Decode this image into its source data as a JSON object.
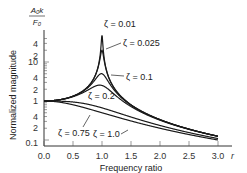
{
  "chart_data": {
    "type": "line",
    "title": "",
    "xlabel": "Frequency ratio",
    "x_symbol": "r",
    "ylabel": "Normalized magnitude",
    "ylabel_fraction": {
      "numerator": "A0k",
      "denominator": "F0"
    },
    "xlim": [
      0,
      3.0
    ],
    "ylim": [
      0.1,
      50
    ],
    "yscale": "log",
    "grid": false,
    "x_ticks": [
      0.0,
      0.5,
      1.0,
      1.5,
      2.0,
      2.5,
      3.0
    ],
    "x_tick_labels": [
      "0.0",
      "0.5",
      "1.0",
      "1.5",
      "2.0",
      "2.5",
      "3.0"
    ],
    "y_ticks": [
      0.1,
      0.2,
      0.4,
      1,
      2,
      4,
      10,
      20,
      40
    ],
    "y_tick_labels": [
      "0.1",
      "2",
      "4",
      "1",
      "2",
      "4",
      "10",
      "2",
      "4"
    ],
    "series": [
      {
        "name": "ζ = 0.01",
        "zeta": 0.01
      },
      {
        "name": "ζ = 0.025",
        "zeta": 0.025
      },
      {
        "name": "ζ = 0.1",
        "zeta": 0.1
      },
      {
        "name": "ζ = 0.2",
        "zeta": 0.2
      },
      {
        "name": "ζ = 0.75",
        "zeta": 0.75
      },
      {
        "name": "ζ = 1.0",
        "zeta": 1.0
      }
    ],
    "x": [
      0,
      0.25,
      0.5,
      0.75,
      0.9,
      0.95,
      1.0,
      1.05,
      1.1,
      1.25,
      1.5,
      2.0,
      2.5,
      3.0
    ],
    "values_formula": "1/sqrt((1-r^2)^2 + (2*zeta*r)^2)",
    "sample_values": {
      "ζ = 0.01": [
        1.0,
        1.07,
        1.33,
        2.29,
        5.26,
        10.2,
        50.0,
        9.7,
        4.76,
        1.78,
        0.8,
        0.33,
        0.19,
        0.125
      ],
      "ζ = 0.025": [
        1.0,
        1.07,
        1.33,
        2.28,
        5.14,
        9.1,
        20.0,
        8.7,
        4.66,
        1.77,
        0.8,
        0.33,
        0.19,
        0.125
      ],
      "ζ = 0.1": [
        1.0,
        1.06,
        1.31,
        2.16,
        3.82,
        4.37,
        5.0,
        4.13,
        3.15,
        1.66,
        0.78,
        0.33,
        0.19,
        0.125
      ],
      "ζ = 0.2": [
        1.0,
        1.06,
        1.28,
        1.89,
        2.41,
        2.5,
        2.5,
        2.27,
        1.98,
        1.41,
        0.74,
        0.32,
        0.19,
        0.124
      ],
      "ζ = 0.75": [
        1.0,
        0.97,
        0.83,
        0.62,
        0.56,
        0.53,
        0.67,
        0.48,
        0.45,
        0.38,
        0.33,
        0.23,
        0.15,
        0.11
      ],
      "ζ = 1.0": [
        1.0,
        0.94,
        0.8,
        0.64,
        0.55,
        0.53,
        0.5,
        0.48,
        0.45,
        0.39,
        0.31,
        0.2,
        0.14,
        0.1
      ]
    },
    "annotations": [
      "ζ = 0.01",
      "ζ = 0.025",
      "ζ = 0.1",
      "ζ = 0.2",
      "ζ = 0.75",
      "ζ = 1.0"
    ],
    "legend_position": "inline annotations with arrows"
  },
  "labels": {
    "y_frac_num": "A₀k",
    "y_frac_den": "F₀",
    "ylabel": "Normalized magnitude",
    "xlabel": "Frequency ratio",
    "x_symbol": "r",
    "zeta_001": "ζ = 0.01",
    "zeta_0025": "ζ = 0.025",
    "zeta_01": "ζ = 0.1",
    "zeta_02": "ζ = 0.2",
    "zeta_075": "ζ = 0.75",
    "zeta_10": "ζ = 1.0",
    "xt0": "0.0",
    "xt1": "0.5",
    "xt2": "1.0",
    "xt3": "1.5",
    "xt4": "2.0",
    "xt5": "2.5",
    "xt6": "3.0",
    "yt_40": "4",
    "yt_20": "2",
    "yt_10": "10",
    "yt_4": "4",
    "yt_2": "2",
    "yt_1": "1",
    "yt_04": "4",
    "yt_02": "2",
    "yt_01": "0.1"
  },
  "colors": {
    "curve": "#1a1a1a",
    "axis": "#333333",
    "text": "#222222"
  }
}
